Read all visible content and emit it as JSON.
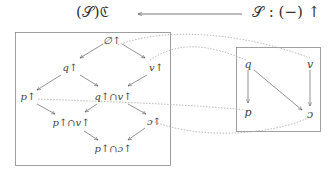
{
  "header": {
    "left_label": "(𝒮)ℭ",
    "right_label": "𝒮 : (−) ↑",
    "arrow_direction": "right-to-left"
  },
  "left_box": {
    "nodes": [
      {
        "id": "empty",
        "label": "∅↑"
      },
      {
        "id": "q",
        "label": "q↑"
      },
      {
        "id": "v",
        "label": "v↑"
      },
      {
        "id": "p",
        "label": "p↑"
      },
      {
        "id": "qv",
        "label": "q↑∩v↑"
      },
      {
        "id": "pv",
        "label": "p↑∩v↑"
      },
      {
        "id": "c",
        "label": "ɔ↑"
      },
      {
        "id": "pc",
        "label": "p↑∩ɔ↑"
      }
    ]
  },
  "right_box": {
    "nodes": [
      {
        "id": "rq",
        "label": "q"
      },
      {
        "id": "rv",
        "label": "v"
      },
      {
        "id": "rp",
        "label": "p"
      },
      {
        "id": "rc",
        "label": "ɔ"
      }
    ]
  },
  "colors": {
    "line": "#555555",
    "box": "#888888",
    "dotted": "#999999"
  }
}
